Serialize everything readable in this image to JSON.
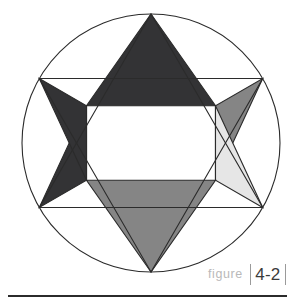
{
  "figure": {
    "caption_label": "figure",
    "caption_number": "4-2",
    "title_alt": "Star of David inscribed in circle",
    "colors": {
      "background": "#ffffff",
      "outline": "#2b2b2b",
      "center_hexagon": "#ffffff",
      "point_dark": "#333335",
      "point_mid_gray": "#858585",
      "point_light_gray": "#e6e6e6",
      "caption_label_color": "#b9b9b9",
      "caption_number_color": "#3b3b3b",
      "caption_bar_color": "#9a9a9a",
      "rule_color": "#2b2b2b"
    },
    "geometry": {
      "circle_cx": 151,
      "circle_cy": 143,
      "circle_r": 129,
      "star_outer_r": 129,
      "star_inner_r": 74.5
    },
    "points": [
      {
        "name": "top",
        "fill": "#333335"
      },
      {
        "name": "upper-right",
        "fill": "#858585"
      },
      {
        "name": "lower-right",
        "fill": "#e6e6e6"
      },
      {
        "name": "bottom",
        "fill": "#858585"
      },
      {
        "name": "lower-left",
        "fill": "#333335"
      },
      {
        "name": "upper-left",
        "fill": "#333335"
      }
    ]
  }
}
